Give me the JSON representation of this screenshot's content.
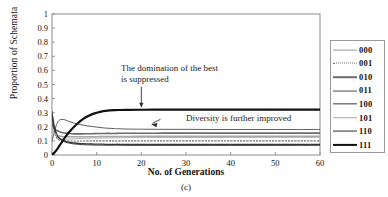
{
  "chart_data": {
    "type": "line",
    "title": "",
    "caption": "(c)",
    "xlabel": "No. of Generations",
    "ylabel": "Proportion of Schemata",
    "xlim": [
      0,
      60
    ],
    "ylim": [
      0,
      1
    ],
    "xticks": [
      0,
      10,
      20,
      30,
      40,
      50,
      60
    ],
    "yticks": [
      "0",
      "0.1",
      "0.2",
      "0.3",
      "0.4",
      "0.5",
      "0.6",
      "0.7",
      "0.8",
      "0.9",
      "1"
    ],
    "grid": false,
    "legend_position": "right-outside",
    "x": [
      0,
      0.5,
      1,
      1.5,
      2,
      2.5,
      3,
      4,
      5,
      6,
      7,
      8,
      9,
      10,
      11,
      12,
      13,
      14,
      15,
      17,
      20,
      25,
      30,
      35,
      40,
      45,
      50,
      55,
      60
    ],
    "series": [
      {
        "name": "000",
        "color": "#9a9a9a",
        "width": 0.8,
        "dash": "solid",
        "values": [
          0.3,
          0.2,
          0.14,
          0.12,
          0.115,
          0.112,
          0.112,
          0.113,
          0.115,
          0.117,
          0.118,
          0.119,
          0.12,
          0.12,
          0.121,
          0.121,
          0.122,
          0.122,
          0.122,
          0.123,
          0.123,
          0.124,
          0.124,
          0.124,
          0.125,
          0.125,
          0.125,
          0.125,
          0.125
        ]
      },
      {
        "name": "001",
        "color": "#6e6e6e",
        "width": 1.1,
        "dash": "dotted",
        "values": [
          0.26,
          0.17,
          0.125,
          0.108,
          0.103,
          0.101,
          0.1,
          0.099,
          0.099,
          0.099,
          0.099,
          0.1,
          0.1,
          0.1,
          0.1,
          0.1,
          0.1,
          0.1,
          0.1,
          0.1,
          0.1,
          0.1,
          0.1,
          0.1,
          0.1,
          0.1,
          0.1,
          0.1,
          0.1
        ]
      },
      {
        "name": "010",
        "color": "#6b6b6b",
        "width": 1.6,
        "dash": "solid",
        "values": [
          0.22,
          0.19,
          0.175,
          0.168,
          0.162,
          0.158,
          0.155,
          0.152,
          0.15,
          0.15,
          0.15,
          0.151,
          0.151,
          0.152,
          0.152,
          0.153,
          0.153,
          0.153,
          0.154,
          0.154,
          0.154,
          0.155,
          0.155,
          0.155,
          0.155,
          0.155,
          0.155,
          0.155,
          0.155
        ]
      },
      {
        "name": "011",
        "color": "#4a4a4a",
        "width": 0.9,
        "dash": "solid",
        "values": [
          0.1,
          0.16,
          0.215,
          0.243,
          0.252,
          0.252,
          0.248,
          0.236,
          0.226,
          0.218,
          0.212,
          0.206,
          0.202,
          0.198,
          0.194,
          0.191,
          0.189,
          0.187,
          0.186,
          0.184,
          0.183,
          0.182,
          0.182,
          0.181,
          0.181,
          0.181,
          0.181,
          0.181,
          0.181
        ]
      },
      {
        "name": "100",
        "color": "#3a3a3a",
        "width": 1.3,
        "dash": "solid",
        "values": [
          0.28,
          0.19,
          0.145,
          0.122,
          0.11,
          0.102,
          0.096,
          0.089,
          0.085,
          0.082,
          0.08,
          0.079,
          0.078,
          0.077,
          0.077,
          0.076,
          0.076,
          0.076,
          0.076,
          0.075,
          0.075,
          0.075,
          0.075,
          0.075,
          0.075,
          0.075,
          0.075,
          0.075,
          0.075
        ]
      },
      {
        "name": "101",
        "color": "#a8a8a8",
        "width": 1.5,
        "dash": "solid",
        "values": [
          0.18,
          0.155,
          0.142,
          0.136,
          0.133,
          0.131,
          0.13,
          0.129,
          0.129,
          0.129,
          0.129,
          0.13,
          0.13,
          0.13,
          0.131,
          0.131,
          0.131,
          0.132,
          0.132,
          0.132,
          0.133,
          0.133,
          0.133,
          0.133,
          0.133,
          0.133,
          0.133,
          0.133,
          0.133
        ]
      },
      {
        "name": "110",
        "color": "#2e2e2e",
        "width": 0.9,
        "dash": "solid",
        "values": [
          0.31,
          0.21,
          0.155,
          0.125,
          0.108,
          0.098,
          0.091,
          0.083,
          0.078,
          0.075,
          0.073,
          0.072,
          0.071,
          0.07,
          0.07,
          0.069,
          0.069,
          0.069,
          0.069,
          0.068,
          0.068,
          0.068,
          0.068,
          0.068,
          0.068,
          0.068,
          0.068,
          0.068,
          0.068
        ]
      },
      {
        "name": "111",
        "color": "#111111",
        "width": 2.2,
        "dash": "solid",
        "values": [
          0.005,
          0.015,
          0.035,
          0.058,
          0.082,
          0.105,
          0.128,
          0.168,
          0.202,
          0.232,
          0.256,
          0.275,
          0.29,
          0.3,
          0.308,
          0.313,
          0.316,
          0.318,
          0.319,
          0.32,
          0.321,
          0.322,
          0.322,
          0.322,
          0.322,
          0.322,
          0.322,
          0.322,
          0.322
        ]
      }
    ],
    "annotations": [
      {
        "text": "The domination of the best\nis suppressed",
        "arrow": "down",
        "target_x": 20,
        "target_y": 0.33
      },
      {
        "text": "Diversity is further improved",
        "arrow": "left-down",
        "target_x": 21,
        "target_y": 0.19
      }
    ]
  },
  "legend": {
    "items": [
      {
        "label": "000"
      },
      {
        "label": "001"
      },
      {
        "label": "010"
      },
      {
        "label": "011"
      },
      {
        "label": "100"
      },
      {
        "label": "101"
      },
      {
        "label": "110"
      },
      {
        "label": "111"
      }
    ]
  }
}
